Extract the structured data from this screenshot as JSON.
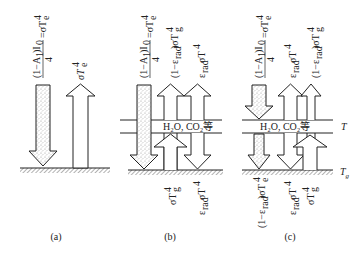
{
  "figure": {
    "panels": [
      {
        "id": "a",
        "caption": "(a)",
        "labels_top": [
          "(1−A₁)I₀/4 = σT⁴ₑ",
          "σT⁴ₑ"
        ],
        "labels_bottom": []
      },
      {
        "id": "b",
        "caption": "(b)",
        "layer_label": "H₂O, CO₂等",
        "labels_top": [
          "(1−A₁)I₀/4 = σT⁴ₑ",
          "(1−ε_rad)σT⁴_g",
          "ε_rad σT⁴"
        ],
        "labels_bottom": [
          "σT⁴_g",
          "ε_rad σT⁴"
        ]
      },
      {
        "id": "c",
        "caption": "(c)",
        "layer_label": "H₂O, CO₂等",
        "layer_temp_label": "T",
        "ground_temp_label": "T_g",
        "labels_top": [
          "(1−A₁)I₀/4 = σT⁴ₑ",
          "ε_rad σT⁴",
          "(1−ε_rad)σT⁴_g"
        ],
        "labels_bottom": [
          "(1−ε_rad)σT⁴ₑ",
          "ε_rad σT⁴",
          "σT⁴_g"
        ]
      }
    ],
    "colors": {
      "line": "#222222",
      "stipple": "#9a9a9a",
      "hatch": "#555555"
    }
  }
}
